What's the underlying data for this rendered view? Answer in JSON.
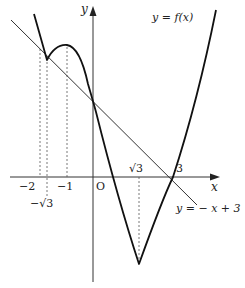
{
  "figure": {
    "type": "function-graph",
    "colors": {
      "curve": "#111111",
      "line": "#333333",
      "axes": "#333333",
      "guides": "#555555",
      "background": "#ffffff"
    },
    "axes": {
      "x_label": "x",
      "y_label": "y",
      "origin_label": "O"
    },
    "x_tick_labels": {
      "neg_two": "−2",
      "neg_sqrt3": "−√3",
      "neg_one": "−1",
      "sqrt3": "√3",
      "three": "3"
    },
    "curve_label": "y = f(x)",
    "line_label": "y = − x + 3",
    "key_points": [
      {
        "name": "intersection-left",
        "x": -2,
        "y": 5
      },
      {
        "name": "cusp",
        "x": "-√3",
        "y": "local min"
      },
      {
        "name": "local-max",
        "x": -1,
        "y": "local max"
      },
      {
        "name": "y-intercept",
        "x": 0,
        "y": 3
      },
      {
        "name": "minimum",
        "x": "√3",
        "y": "min"
      },
      {
        "name": "x-intercept",
        "x": 3,
        "y": 0
      }
    ],
    "guide_lines": [
      "x=-2",
      "x=-√3",
      "x=-1",
      "x=√3"
    ]
  }
}
